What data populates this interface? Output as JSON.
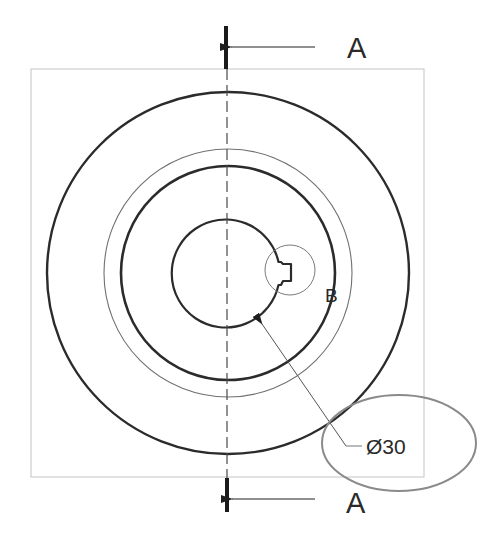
{
  "drawing": {
    "type": "engineering-section-view",
    "frame": {
      "x": 31,
      "y": 69,
      "width": 393,
      "height": 408,
      "stroke": "#bdbdbd"
    },
    "center": {
      "x": 228,
      "y": 273
    },
    "circles": [
      {
        "name": "outer-circle",
        "r": 181,
        "stroke": "#2b2b2b",
        "width": 2.4
      },
      {
        "name": "thin-circle",
        "r": 124,
        "stroke": "#6a6a6a",
        "width": 1.1
      },
      {
        "name": "middle-circle",
        "r": 107,
        "stroke": "#2b2b2b",
        "width": 2.6
      },
      {
        "name": "bore-circle",
        "r": 54,
        "stroke": "#2b2b2b",
        "width": 2.2
      }
    ],
    "centerline": {
      "x": 227,
      "y1": 69,
      "y2": 478,
      "stroke": "#4a4a4a"
    },
    "section_markers": {
      "top": {
        "label": "A",
        "bar_x": 226,
        "bar_y1": 26,
        "bar_y2": 69,
        "arrow_y": 47,
        "arrow_x1": 230,
        "arrow_x2": 315,
        "label_x": 348,
        "label_y": 58
      },
      "bottom": {
        "label": "A",
        "bar_x": 227,
        "bar_y1": 478,
        "bar_y2": 512,
        "arrow_y": 499,
        "arrow_x1": 231,
        "arrow_x2": 315,
        "label_x": 347,
        "label_y": 513
      }
    },
    "detail": {
      "label": "B",
      "cx": 290,
      "cy": 270,
      "r": 25,
      "label_x": 325,
      "label_y": 302
    },
    "dimension": {
      "text": "Ø30",
      "arrow_tip": {
        "x": 260,
        "y": 321
      },
      "elbow": {
        "x": 346,
        "y": 446
      },
      "leader_end": {
        "x": 362,
        "y": 446
      },
      "text_x": 368,
      "text_y": 454
    },
    "highlight_ellipse": {
      "cx": 399,
      "cy": 443,
      "rx": 77,
      "ry": 48,
      "stroke": "#8a8a8a"
    }
  }
}
